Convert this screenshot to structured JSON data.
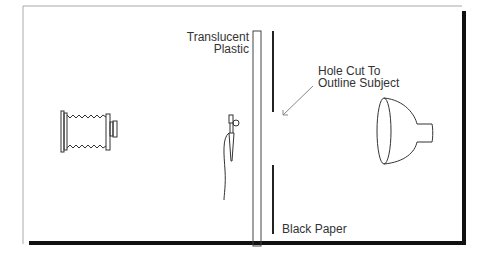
{
  "diagram": {
    "labels": {
      "plastic_line1": "Translucent",
      "plastic_line2": "Plastic",
      "hole_line1": "Hole Cut To",
      "hole_line2": "Outline Subject",
      "paper": "Black Paper"
    },
    "components": [
      "camera",
      "small-light",
      "translucent-plastic",
      "black-paper",
      "reflector-light"
    ],
    "colors": {
      "line": "#333333",
      "frame_shadow": "#111111",
      "frame_edge": "#999999",
      "arrow": "#888888"
    }
  }
}
